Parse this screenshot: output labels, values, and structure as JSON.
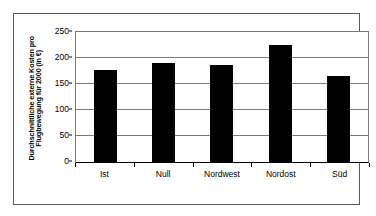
{
  "chart_data": {
    "type": "bar",
    "title": "",
    "subtitle": "",
    "xlabel": "",
    "ylabel": "Durchschnittliche externe Kosten pro Flugbewegung für 2000 (in €)",
    "ylabel_line1": "Durchschnittliche externe Kosten pro",
    "ylabel_line2": "Flugbewegung für 2000 (in €)",
    "categories": [
      "Ist",
      "Null",
      "Nordwest",
      "Nordost",
      "Süd"
    ],
    "values": [
      177,
      191,
      187,
      225,
      166
    ],
    "series": [
      {
        "name": "Durchschnittliche externe Kosten pro Flugbewegung für 2000 (in €)",
        "values": [
          177,
          191,
          187,
          225,
          166
        ]
      }
    ],
    "ylim": [
      0,
      250
    ],
    "yticks": [
      0,
      50,
      100,
      150,
      200,
      250
    ],
    "ytick_labels": [
      "0",
      "50",
      "100",
      "150",
      "200",
      "250"
    ],
    "grid": true,
    "grid_axis": "y",
    "legend": false,
    "legend_position": "none",
    "bar_color": "#000000",
    "plot_background": "#ffffff",
    "frame_color": "#5a5a5a",
    "gridline_color": "#7a7a7a",
    "annotations": []
  }
}
